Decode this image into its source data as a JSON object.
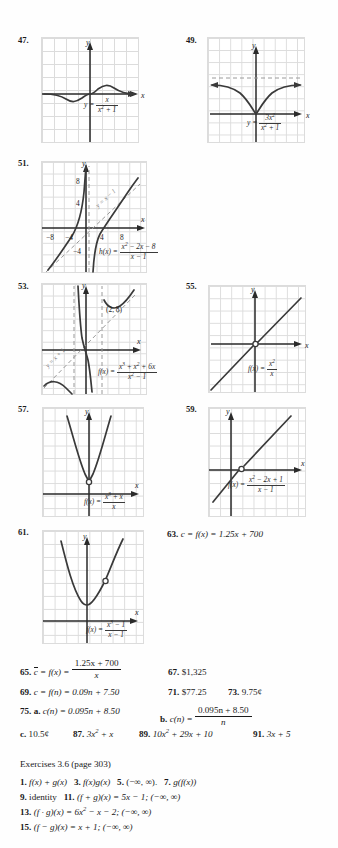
{
  "page": {
    "background": "#fefefe",
    "grid_color": "#dcdcdc",
    "curve_color": "#3a3a3a"
  },
  "problems": [
    {
      "num": "47.",
      "label_x": "x",
      "label_y": "y",
      "equation_lhs": "y =",
      "num_text": "x",
      "den_text": "x² + 1",
      "caption": "y = x/(x² + 1)"
    },
    {
      "num": "49.",
      "label_x": "x",
      "label_y": "y",
      "equation_lhs": "y =",
      "num_text": "3x²",
      "den_text": "x² + 1",
      "caption": "y = 3x²/(x² + 1)",
      "asymptote": "y = 3"
    },
    {
      "num": "51.",
      "label_x": "x",
      "label_y": "y",
      "equation_lhs": "h(x) =",
      "num_text": "x² − 2x − 8",
      "den_text": "x − 1",
      "asymptote_label": "y = x − 1",
      "xticks": [
        "−8",
        "−4",
        "4",
        "8"
      ],
      "yticks": [
        "8",
        "4",
        "−4"
      ]
    },
    {
      "num": "53.",
      "label_x": "x",
      "label_y": "y",
      "equation_lhs": "f(x) =",
      "num_text": "x³ + x² + 6x",
      "den_text": "x² − 1",
      "asymptote_label": "y = x + 1",
      "point_label": "(2, 8)"
    },
    {
      "num": "55.",
      "label_x": "x",
      "label_y": "y",
      "equation_lhs": "f(x) =",
      "num_text": "x²",
      "den_text": "x",
      "hole": "(0, 0)"
    },
    {
      "num": "57.",
      "label_x": "x",
      "label_y": "y",
      "equation_lhs": "f(x) =",
      "num_text": "x³ + x",
      "den_text": "x",
      "hole": "(0, 1)"
    },
    {
      "num": "59.",
      "label_x": "x",
      "label_y": "y",
      "equation_lhs": "f(x) =",
      "num_text": "x² − 2x + 1",
      "den_text": "x − 1",
      "hole": "(1, 0)"
    },
    {
      "num": "61.",
      "label_x": "x",
      "label_y": "y",
      "equation_lhs": "f(x) =",
      "num_text": "x³ − 1",
      "den_text": "x − 1",
      "hole": "(1, 3)"
    }
  ],
  "inline_answers": {
    "a63": {
      "num": "63.",
      "text": "c = f(x) = 1.25x + 700"
    },
    "a65": {
      "num": "65.",
      "lhs": "c = f(x) =",
      "num_text": "1.25x + 700",
      "den_text": "x"
    },
    "a67": {
      "num": "67.",
      "text": "$1,325"
    },
    "a69": {
      "num": "69.",
      "text": "c = f(n) = 0.09n + 7.50"
    },
    "a71": {
      "num": "71.",
      "text": "$77.25"
    },
    "a73": {
      "num": "73.",
      "text": "9.75¢"
    },
    "a75": {
      "num": "75.",
      "part_a_label": "a.",
      "part_a": "c(n) = 0.095n + 8.50",
      "part_b_label": "b.",
      "part_b_lhs": "c(n) =",
      "part_b_num": "0.095n + 8.50",
      "part_b_den": "n",
      "part_c_label": "c.",
      "part_c": "10.5¢"
    },
    "a87": {
      "num": "87.",
      "text": "3x² + x"
    },
    "a89": {
      "num": "89.",
      "text": "10x² + 29x + 10"
    },
    "a91": {
      "num": "91.",
      "text": "3x + 5"
    }
  },
  "section": {
    "heading": "Exercises 3.6 (page 303)",
    "lines": [
      [
        {
          "num": "1.",
          "text": "f(x) + g(x)"
        },
        {
          "num": "3.",
          "text": "f(x)g(x)"
        },
        {
          "num": "5.",
          "text": "(−∞, ∞)."
        },
        {
          "num": "7.",
          "text": "g(f(x))"
        }
      ],
      [
        {
          "num": "9.",
          "text": "identity"
        },
        {
          "num": "11.",
          "text": "(f + g)(x) = 5x − 1; (−∞, ∞)"
        }
      ],
      [
        {
          "num": "13.",
          "text": "(f · g)(x) = 6x² − x − 2; (−∞, ∞)"
        }
      ],
      [
        {
          "num": "15.",
          "text": "(f − g)(x) = x + 1; (−∞, ∞)"
        }
      ]
    ]
  }
}
